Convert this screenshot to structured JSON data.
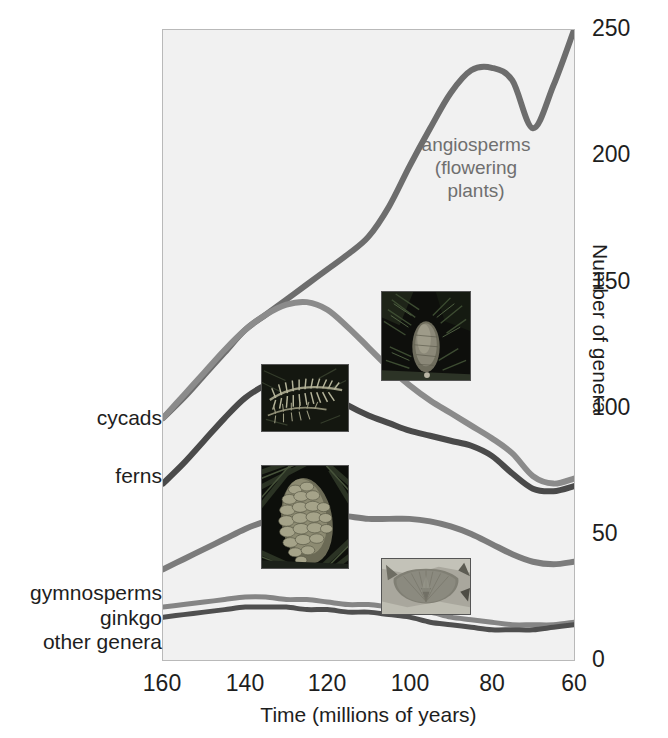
{
  "chart_data": {
    "type": "line",
    "title": "",
    "subtitle": "",
    "xlabel": "Time (millions of years)",
    "ylabel": "Number of genera",
    "xlim": [
      160,
      60
    ],
    "ylim": [
      0,
      250
    ],
    "x_ticks": [
      160,
      140,
      120,
      100,
      80,
      60
    ],
    "y_ticks": [
      0,
      50,
      100,
      150,
      200,
      250
    ],
    "x_axis_reversed": true,
    "grid": false,
    "legend": "inline-labels",
    "annotations": [
      {
        "text": "angiosperms\n(flowering\nplants)",
        "x": 95,
        "y": 185,
        "color": "#6f6f6f"
      }
    ],
    "x": [
      160,
      155,
      150,
      145,
      140,
      135,
      130,
      125,
      120,
      115,
      110,
      105,
      100,
      95,
      90,
      85,
      80,
      75,
      70,
      65,
      60
    ],
    "series": [
      {
        "name": "angiosperms (flowering plants)",
        "label": "angiosperms\n(flowering\nplants)",
        "color": "#6d6d6d",
        "width": 6,
        "values": [
          96,
          104,
          113,
          122,
          131,
          137,
          143,
          149,
          155,
          161,
          168,
          180,
          196,
          211,
          225,
          234,
          235,
          230,
          211,
          228,
          250
        ]
      },
      {
        "name": "cycads",
        "label": "cycads",
        "color": "#8b8b8b",
        "width": 6,
        "values": [
          96,
          105,
          114,
          123,
          131,
          137,
          141,
          142,
          139,
          132,
          124,
          116,
          109,
          103,
          98,
          93,
          88,
          82,
          73,
          70,
          72
        ]
      },
      {
        "name": "ferns",
        "label": "ferns",
        "color": "#4a4a4a",
        "width": 6,
        "values": [
          70,
          78,
          87,
          96,
          104,
          109,
          111,
          110,
          106,
          101,
          97,
          94,
          91,
          89,
          87,
          85,
          81,
          74,
          68,
          67,
          69
        ]
      },
      {
        "name": "gymnosperms",
        "label": "gymnosperms",
        "color": "#7c7c7c",
        "width": 6,
        "values": [
          36,
          40,
          44,
          48,
          52,
          55,
          57,
          58,
          58,
          57,
          56,
          56,
          56,
          55,
          53,
          50,
          46,
          42,
          39,
          38,
          39
        ]
      },
      {
        "name": "ginkgo",
        "label": "ginkgo",
        "color": "#858585",
        "width": 5,
        "values": [
          21,
          22,
          23,
          24,
          25,
          25,
          24,
          24,
          23,
          22,
          22,
          21,
          20,
          19,
          17,
          16,
          15,
          14,
          14,
          14,
          15
        ]
      },
      {
        "name": "other genera",
        "label": "other genera",
        "color": "#4f4f4f",
        "width": 5,
        "values": [
          17,
          18,
          19,
          20,
          21,
          21,
          21,
          20,
          20,
          19,
          19,
          18,
          17,
          15,
          14,
          13,
          12,
          12,
          12,
          13,
          14
        ]
      }
    ]
  },
  "axes": {
    "y_title": "Number of genera",
    "x_title": "Time (millions of years)",
    "y_tick_labels": [
      "250",
      "200",
      "150",
      "100",
      "50",
      "0"
    ],
    "x_tick_labels": [
      "160",
      "140",
      "120",
      "100",
      "80",
      "60"
    ]
  },
  "series_labels": {
    "cycads": "cycads",
    "ferns": "ferns",
    "gymnosperms": "gymnosperms",
    "ginkgo": "ginkgo",
    "other_genera": "other genera"
  },
  "annotation": {
    "angiosperms": "angiosperms\n(flowering\nplants)"
  },
  "photos": [
    {
      "name": "cycad-photo",
      "caption": "cycad cone among fern fronds",
      "tone": "dark"
    },
    {
      "name": "fern-photo",
      "caption": "fern frond",
      "tone": "dark"
    },
    {
      "name": "conifer-cone-photo",
      "caption": "conifer seed cone",
      "tone": "dark"
    },
    {
      "name": "ginkgo-leaf-photo",
      "caption": "ginkgo leaf",
      "tone": "light"
    }
  ],
  "colors": {
    "plot_background": "#f1f1f1",
    "frame": "#b9b9b9",
    "angiosperms": "#6d6d6d",
    "cycads": "#8b8b8b",
    "ferns": "#4a4a4a",
    "gymnosperms": "#7c7c7c",
    "ginkgo": "#858585",
    "other_genera": "#4f4f4f",
    "text": "#1e1e1e",
    "annotation_text": "#6f6f6f"
  }
}
